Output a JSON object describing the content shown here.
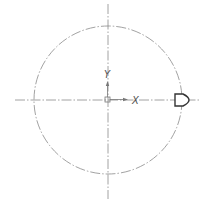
{
  "diagram": {
    "axis_labels": {
      "x": "X",
      "y": "Y"
    },
    "colors": {
      "line": "#888888",
      "symbol": "#333333",
      "background": "#ffffff"
    },
    "circle": {
      "cx": 108,
      "cy": 100,
      "r": 74
    },
    "symbol": "d-shape-marker"
  }
}
